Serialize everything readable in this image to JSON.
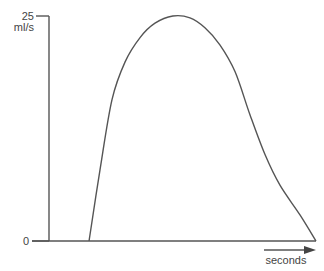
{
  "chart_data": {
    "type": "line",
    "title": "",
    "xlabel": "seconds",
    "ylabel": "ml/s",
    "ylim": [
      0,
      25
    ],
    "xlim": [
      0,
      100
    ],
    "y_ticks": [
      {
        "value": 0,
        "label": "0"
      },
      {
        "value": 25,
        "label": "25"
      }
    ],
    "grid": false,
    "legend": "none",
    "series": [
      {
        "name": "flow",
        "x": [
          15,
          19.1,
          23.6,
          28.5,
          34.1,
          39.7,
          46.4,
          52.8,
          58.4,
          64.0,
          69.7,
          75.3,
          80.9,
          86.5,
          94.0,
          100
        ],
        "y": [
          0,
          7.9,
          15.7,
          19.9,
          22.6,
          24.2,
          25.0,
          24.8,
          23.7,
          21.8,
          18.8,
          14.0,
          9.6,
          6.2,
          2.9,
          0
        ]
      }
    ]
  }
}
